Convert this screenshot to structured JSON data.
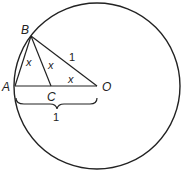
{
  "diagram": {
    "points": {
      "A": {
        "label": "A",
        "x": 15,
        "y": 86
      },
      "B": {
        "label": "B",
        "x": 31,
        "y": 36
      },
      "C": {
        "label": "C",
        "x": 51,
        "y": 86
      },
      "O": {
        "label": "O",
        "x": 97,
        "y": 86
      }
    },
    "circle": {
      "cx": 97,
      "cy": 86,
      "r": 83
    },
    "angle_labels": {
      "at_A": "x",
      "at_B": "x",
      "at_O": "x"
    },
    "length_labels": {
      "BO": "1",
      "AO": "1"
    },
    "stroke_color": "#222222"
  }
}
